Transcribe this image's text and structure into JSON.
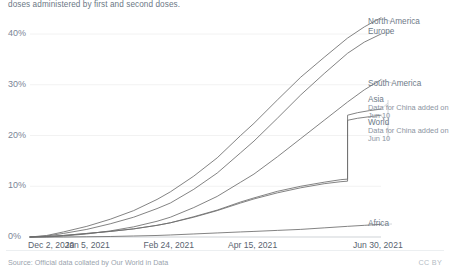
{
  "subtitle": "doses administered by first and second doses.",
  "footer": {
    "source": "Source: Official data collated by Our World in Data",
    "license": "CC BY"
  },
  "colors": {
    "line": "#6d6d6d",
    "gridline": "#f2f2f2",
    "axis": "#cfd3d7",
    "tick_text": "#59636f",
    "label_text": "#6e7a88",
    "annotation_text": "#8b949f",
    "subtitle_text": "#6b7785",
    "footer_text": "#9aa3ad"
  },
  "chart_data": {
    "type": "line",
    "title": "",
    "subtitle": "doses administered by first and second doses.",
    "xlabel": "",
    "ylabel": "",
    "ylim": [
      0,
      45
    ],
    "yticks": [
      "0%",
      "10%",
      "20%",
      "30%",
      "40%"
    ],
    "ytick_values": [
      0,
      10,
      20,
      30,
      40
    ],
    "xticks": [
      "Dec 2, 2020",
      "Jan 5, 2021",
      "Feb 24, 2021",
      "Apr 15, 2021",
      "Jun 30, 2021"
    ],
    "xtick_days": [
      0,
      34,
      84,
      134,
      210
    ],
    "xlim_days": [
      0,
      210
    ],
    "grid": "horizontal",
    "legend_position": "right-inline",
    "annotations": [
      {
        "series": "Asia",
        "text": "Data for China added on Jun 10"
      },
      {
        "series": "World",
        "text": "Data for China added on Jun 10"
      }
    ],
    "series": [
      {
        "name": "North America",
        "label": "North America",
        "end_value": 43.2,
        "x": [
          0,
          10,
          20,
          34,
          48,
          62,
          76,
          84,
          98,
          112,
          126,
          134,
          148,
          162,
          176,
          190,
          200,
          210
        ],
        "values": [
          0.0,
          0.3,
          1.0,
          2.1,
          3.5,
          5.2,
          7.4,
          8.9,
          12.0,
          15.6,
          20.0,
          22.4,
          27.0,
          31.5,
          35.4,
          39.2,
          41.4,
          43.2
        ]
      },
      {
        "name": "Europe",
        "label": "Europe",
        "end_value": 40.0,
        "x": [
          0,
          10,
          20,
          34,
          48,
          62,
          76,
          84,
          98,
          112,
          126,
          134,
          148,
          162,
          176,
          190,
          200,
          210
        ],
        "values": [
          0.0,
          0.2,
          0.7,
          1.5,
          2.6,
          3.9,
          5.6,
          6.7,
          9.4,
          12.6,
          16.6,
          18.9,
          23.4,
          28.0,
          32.2,
          36.2,
          38.4,
          40.0
        ]
      },
      {
        "name": "South America",
        "label": "South America",
        "end_value": 31.0,
        "x": [
          0,
          10,
          20,
          34,
          48,
          62,
          76,
          84,
          98,
          112,
          126,
          134,
          148,
          162,
          176,
          190,
          200,
          210
        ],
        "values": [
          0.0,
          0.0,
          0.2,
          0.6,
          1.2,
          2.0,
          3.1,
          3.9,
          5.8,
          8.0,
          10.8,
          12.4,
          15.8,
          19.4,
          23.0,
          26.6,
          29.0,
          31.0
        ]
      },
      {
        "name": "Asia",
        "label": "Asia",
        "end_value": 25.2,
        "step_day": 190,
        "step_from": 11.4,
        "step_to": 24.0,
        "x": [
          0,
          10,
          20,
          34,
          48,
          62,
          76,
          84,
          98,
          112,
          126,
          134,
          148,
          162,
          176,
          186,
          190,
          190,
          196,
          203,
          210
        ],
        "values": [
          0.0,
          0.1,
          0.3,
          0.7,
          1.1,
          1.6,
          2.3,
          2.8,
          4.0,
          5.3,
          6.9,
          7.7,
          9.0,
          10.0,
          10.8,
          11.3,
          11.4,
          24.0,
          24.5,
          24.9,
          25.2
        ]
      },
      {
        "name": "World",
        "label": "World",
        "end_value": 24.0,
        "step_day": 190,
        "step_from": 11.0,
        "step_to": 23.0,
        "x": [
          0,
          10,
          20,
          34,
          48,
          62,
          76,
          84,
          98,
          112,
          126,
          134,
          148,
          162,
          176,
          186,
          190,
          190,
          196,
          203,
          210
        ],
        "values": [
          0.0,
          0.1,
          0.3,
          0.7,
          1.1,
          1.6,
          2.3,
          2.8,
          3.9,
          5.2,
          6.7,
          7.5,
          8.7,
          9.7,
          10.5,
          10.9,
          11.0,
          23.0,
          23.4,
          23.7,
          24.0
        ]
      },
      {
        "name": "Africa",
        "label": "Africa",
        "end_value": 2.5,
        "x": [
          0,
          10,
          20,
          34,
          48,
          62,
          76,
          84,
          98,
          112,
          126,
          134,
          148,
          162,
          176,
          190,
          200,
          210
        ],
        "values": [
          0.0,
          0.0,
          0.0,
          0.05,
          0.1,
          0.2,
          0.3,
          0.4,
          0.6,
          0.8,
          1.0,
          1.1,
          1.3,
          1.5,
          1.8,
          2.1,
          2.3,
          2.5
        ]
      }
    ]
  }
}
